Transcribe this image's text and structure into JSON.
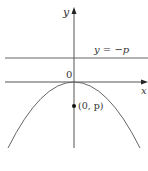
{
  "figure": {
    "axes": {
      "y_label": "y",
      "x_label": "x",
      "origin_label": "0"
    },
    "directrix": {
      "label": "y = −p"
    },
    "focus": {
      "label": "(0, p)"
    },
    "caption": {
      "text": "",
      "note": "caption clipped at bottom edge; only tops of glyphs visible, text not legible"
    },
    "colors": {
      "line": "#555555",
      "curve": "#666666",
      "point": "#111111",
      "background": "#ffffff"
    }
  }
}
